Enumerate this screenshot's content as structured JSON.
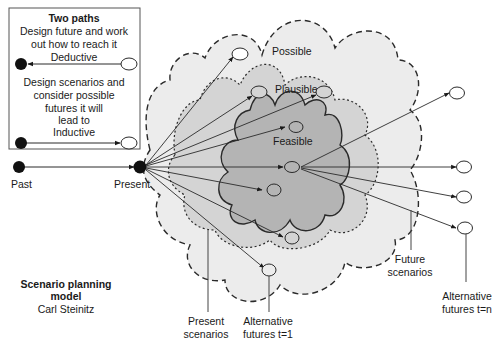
{
  "legend": {
    "title": "Two paths",
    "deductive": {
      "description_lines": [
        "Design future and work",
        "out how to reach it"
      ],
      "label": "Deductive"
    },
    "inductive": {
      "description_lines": [
        "Design scenarios and",
        "consider possible",
        "futures it will",
        "lead to"
      ],
      "label": "Inductive"
    }
  },
  "timeline": {
    "past_label": "Past",
    "present_label": "Present"
  },
  "regions": {
    "possible": "Possible",
    "plausible": "Plausible",
    "feasible": "Feasible"
  },
  "callouts": {
    "present_scenarios": [
      "Present",
      "scenarios"
    ],
    "alternative_futures_t1": [
      "Alternative",
      "futures t=1"
    ],
    "future_scenarios": [
      "Future",
      "scenarios"
    ],
    "alternative_futures_tn": [
      "Alternative",
      "futures t=n"
    ]
  },
  "caption": {
    "title_lines": [
      "Scenario planning",
      "model"
    ],
    "author": "Carl Steinitz"
  },
  "colors": {
    "possible_fill": "#ececec",
    "plausible_fill": "#d4d4d4",
    "feasible_fill": "#b4b4b4",
    "line": "#2a2a2a"
  }
}
